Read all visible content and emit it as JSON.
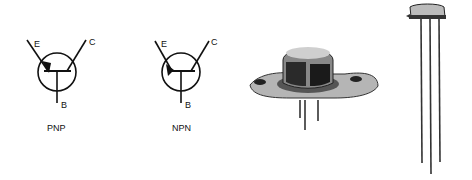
{
  "symbols": [
    {
      "type": "PNP",
      "caption": "PNP",
      "emitter": "E",
      "collector": "C",
      "base": "B"
    },
    {
      "type": "NPN",
      "caption": "NPN",
      "emitter": "E",
      "collector": "C",
      "base": "B"
    }
  ],
  "photos": [
    {
      "name": "power-transistor-to3-package"
    },
    {
      "name": "small-signal-transistor-to18-package"
    }
  ],
  "colors": {
    "ink": "#111111",
    "background": "#ffffff"
  }
}
